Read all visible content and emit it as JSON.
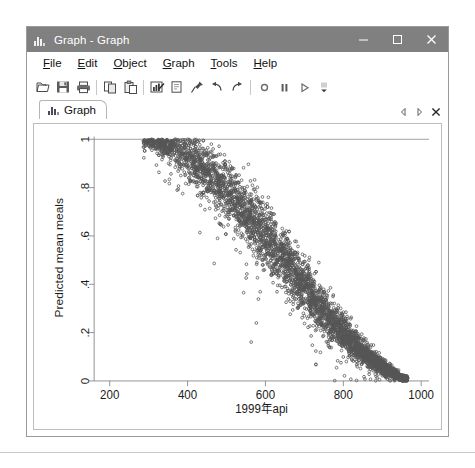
{
  "window": {
    "title": "Graph - Graph",
    "icon": "bar-chart-icon",
    "buttons": {
      "minimize": "minimize-button",
      "maximize": "maximize-button",
      "close": "close-button"
    }
  },
  "menu": {
    "items": [
      {
        "label": "File",
        "accel": "F"
      },
      {
        "label": "Edit",
        "accel": "E"
      },
      {
        "label": "Object",
        "accel": "O"
      },
      {
        "label": "Graph",
        "accel": "G"
      },
      {
        "label": "Tools",
        "accel": "T"
      },
      {
        "label": "Help",
        "accel": "H"
      }
    ]
  },
  "toolbar": {
    "items": [
      "open-icon",
      "save-icon",
      "print-icon",
      "copy-icon",
      "paste-icon",
      "graph-editor-icon",
      "new-graph-icon",
      "pin-icon",
      "undo-icon",
      "redo-icon",
      "record-icon",
      "pause-icon",
      "play-icon"
    ],
    "overflow": "toolbar-overflow-icon"
  },
  "tabs": {
    "items": [
      {
        "label": "Graph",
        "icon": "bar-chart-icon",
        "active": true
      }
    ],
    "nav": {
      "prev": "prev-tab-icon",
      "next": "next-tab-icon",
      "close": "close-tab-icon"
    }
  },
  "chart_data": {
    "type": "scatter",
    "title": "",
    "xlabel": "1999年api",
    "ylabel": "Predicted mean meals",
    "xlim": [
      160,
      1020
    ],
    "ylim": [
      0,
      1.02
    ],
    "xticks": [
      200,
      400,
      600,
      800,
      1000
    ],
    "xticklabels": [
      "200",
      "400",
      "600",
      "800",
      "1000"
    ],
    "yticks": [
      0,
      0.2,
      0.4,
      0.6,
      0.8,
      1
    ],
    "yticklabels": [
      "0",
      ".2",
      ".4",
      ".6",
      ".8",
      "1"
    ],
    "grid": false,
    "marker": {
      "shape": "circle",
      "filled": false,
      "size": 2.6,
      "color": "#555555"
    },
    "reference_line": {
      "y": 1,
      "color": "#9a9a9a"
    },
    "n_points": 4200,
    "series": [
      {
        "name": "Predicted mean meals vs api99",
        "description": "Dense monotonically decreasing S-shaped band from (290, 1.0) to (960, 0.0); spread widest near the middle of the api range, converging at both ends.",
        "x_range": [
          285,
          965
        ],
        "y_range": [
          0.0,
          1.0
        ],
        "anchors": [
          {
            "x": 300,
            "y": 0.99
          },
          {
            "x": 350,
            "y": 0.97
          },
          {
            "x": 400,
            "y": 0.93
          },
          {
            "x": 450,
            "y": 0.87
          },
          {
            "x": 500,
            "y": 0.79
          },
          {
            "x": 550,
            "y": 0.7
          },
          {
            "x": 600,
            "y": 0.6
          },
          {
            "x": 650,
            "y": 0.5
          },
          {
            "x": 700,
            "y": 0.39
          },
          {
            "x": 750,
            "y": 0.29
          },
          {
            "x": 800,
            "y": 0.2
          },
          {
            "x": 850,
            "y": 0.12
          },
          {
            "x": 900,
            "y": 0.06
          },
          {
            "x": 950,
            "y": 0.01
          }
        ],
        "band_halfwidth": [
          0.02,
          0.05,
          0.08,
          0.1,
          0.11,
          0.115,
          0.115,
          0.11,
          0.1,
          0.085,
          0.07,
          0.05,
          0.03,
          0.012
        ]
      }
    ]
  }
}
